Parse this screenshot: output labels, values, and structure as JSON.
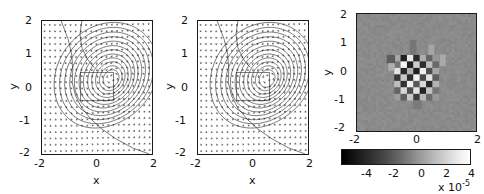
{
  "figure": {
    "type": "multi-panel-scientific-figure",
    "panel_count": 3,
    "background": "#ffffff"
  },
  "panels": [
    {
      "id": "panel-1",
      "kind": "quiver-contour",
      "xlabel": "x",
      "ylabel": "y",
      "xticks": [
        "-2",
        "0",
        "2"
      ],
      "yticks": [
        "-2",
        "-1",
        "0",
        "1",
        "2"
      ],
      "xlim": [
        -2,
        2
      ],
      "ylim": [
        -2,
        2
      ]
    },
    {
      "id": "panel-2",
      "kind": "quiver-contour",
      "xlabel": "x",
      "ylabel": "y",
      "xticks": [
        "-2",
        "0",
        "2"
      ],
      "yticks": [
        "-2",
        "-1",
        "0",
        "1",
        "2"
      ],
      "xlim": [
        -2,
        2
      ],
      "ylim": [
        -2,
        2
      ]
    },
    {
      "id": "panel-3",
      "kind": "image-grayscale",
      "xlabel": "",
      "ylabel": "y",
      "xticks": [
        "-2",
        "0",
        "2"
      ],
      "yticks": [
        "-2",
        "-1",
        "0",
        "1",
        "2"
      ],
      "xlim": [
        -2,
        2
      ],
      "ylim": [
        -2,
        2
      ]
    }
  ],
  "colorbar": {
    "orientation": "horizontal",
    "cmap": "gray",
    "ticks": [
      "-4",
      "-2",
      "0",
      "2",
      "4"
    ],
    "exponent_prefix": "x 10",
    "exponent_value": "-5",
    "vmin": -5,
    "vmax": 5
  },
  "chart_data": [
    {
      "type": "quiver",
      "title": "",
      "xlabel": "x",
      "ylabel": "y",
      "xlim": [
        -2,
        2
      ],
      "ylim": [
        -2,
        2
      ],
      "xticks": [
        -2,
        0,
        2
      ],
      "yticks": [
        -2,
        -1,
        0,
        1,
        2
      ],
      "grid": false,
      "legend": "none",
      "description": "Vector field with nested closed contour lines; contours spiral around a centre near (0.55,0.25); a long open contour sweeps from the upper-left edge down to the lower-right corner. A square inner region from -0.6 to 0.6 in x and -0.4 to 0.45 in y is outlined.",
      "contour_center": [
        0.55,
        0.25
      ],
      "contour_levels": 12,
      "inner_box": {
        "x0": -0.6,
        "x1": 0.6,
        "y0": -0.4,
        "y1": 0.45
      },
      "vector_grid": {
        "nx": 21,
        "ny": 21,
        "spacing": 0.2
      }
    },
    {
      "type": "quiver",
      "title": "",
      "xlabel": "x",
      "ylabel": "y",
      "xlim": [
        -2,
        2
      ],
      "ylim": [
        -2,
        2
      ],
      "xticks": [
        -2,
        0,
        2
      ],
      "yticks": [
        -2,
        -1,
        0,
        1,
        2
      ],
      "grid": false,
      "legend": "none",
      "description": "Reconstructed vector field, visually identical to panel 1: same nested contours about (0.55,0.25), same open sweeping contour and inner square region.",
      "contour_center": [
        0.55,
        0.25
      ],
      "contour_levels": 12,
      "inner_box": {
        "x0": -0.6,
        "x1": 0.6,
        "y0": -0.4,
        "y1": 0.45
      },
      "vector_grid": {
        "nx": 21,
        "ny": 21,
        "spacing": 0.2
      }
    },
    {
      "type": "heatmap",
      "title": "",
      "xlabel": "",
      "ylabel": "y",
      "xlim": [
        -2,
        2
      ],
      "ylim": [
        -2,
        2
      ],
      "xticks": [
        -2,
        0,
        2
      ],
      "yticks": [
        -2,
        -1,
        0,
        1,
        2
      ],
      "cmap": "gray",
      "clim": [
        -5e-05,
        5e-05
      ],
      "colorbar_ticks": [
        -4,
        -2,
        0,
        2,
        4
      ],
      "colorbar_exponent": -5,
      "grid": false,
      "legend": "none",
      "description": "Difference/residual map. Uniform mid-grey (near zero) background with faint noise; a compact blocky checker-like cluster of strong positive (white) and negative (black) cells occupies roughly -0.7<x<0.7 and -0.9<y<0.6, with two lighter vertical streaks extending upward near x=-0.1 and x=0.5 to about y=1.1, and a darker patch near (-0.75,0.45)."
    }
  ]
}
